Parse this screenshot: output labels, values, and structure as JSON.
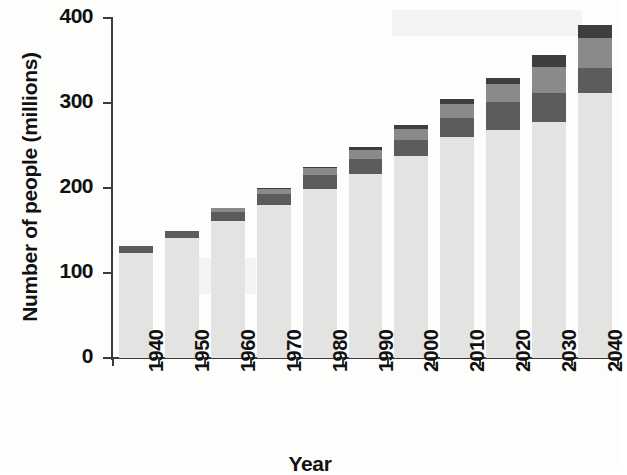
{
  "chart_data": {
    "type": "bar",
    "stacked": true,
    "title": "",
    "xlabel": "Year",
    "ylabel": "Number of people (millions)",
    "categories": [
      "1940",
      "1950",
      "1960",
      "1970",
      "1980",
      "1990",
      "2000",
      "2010",
      "2020",
      "2030",
      "2040"
    ],
    "x": [
      1940,
      1950,
      1960,
      1970,
      1980,
      1990,
      2000,
      2010,
      2020,
      2030,
      2040
    ],
    "ylim": [
      0,
      400
    ],
    "yticks": [
      0,
      100,
      200,
      300,
      400
    ],
    "ytick_labels": [
      "0",
      "100",
      "200",
      "300",
      "400"
    ],
    "xlim": [
      1935,
      2045
    ],
    "grid": false,
    "legend": "none",
    "series": [
      {
        "name": "Under 65",
        "color": "#e3e3e1",
        "values": [
          124,
          141,
          161,
          180,
          199,
          216,
          238,
          260,
          268,
          278,
          312
        ]
      },
      {
        "name": "65-74",
        "color": "#5c5c5c",
        "values": [
          8,
          8,
          11,
          13,
          16,
          18,
          19,
          22,
          33,
          34,
          29
        ]
      },
      {
        "name": "75-84",
        "color": "#8a8a8a",
        "values": [
          0,
          0,
          4,
          6,
          8,
          11,
          13,
          17,
          21,
          30,
          36
        ]
      },
      {
        "name": "85 and over",
        "color": "#3e3e3e",
        "values": [
          0,
          0,
          0,
          1,
          2,
          3,
          4,
          6,
          8,
          14,
          15
        ]
      }
    ],
    "totals": [
      132,
      149,
      176,
      200,
      225,
      248,
      274,
      305,
      330,
      356,
      392
    ],
    "totals_note": "Totals read from stacked bar tops against the y-axis (millions of people)"
  },
  "axes": {
    "y_title": "Number of people (millions)",
    "x_title": "Year",
    "y_tick_labels": [
      "400",
      "300",
      "200",
      "100",
      "0"
    ],
    "x_tick_labels": [
      "1940",
      "1950",
      "1960",
      "1970",
      "1980",
      "1990",
      "2000",
      "2010",
      "2020",
      "2030",
      "2040"
    ]
  },
  "colors": {
    "axis": "#3b3b3b",
    "background": "#fdfdfc",
    "text": "#111111",
    "segment_light": "#e3e3e1",
    "segment_dark": "#5c5c5c",
    "segment_medium": "#8a8a8a",
    "segment_darkest": "#3e3e3e"
  }
}
